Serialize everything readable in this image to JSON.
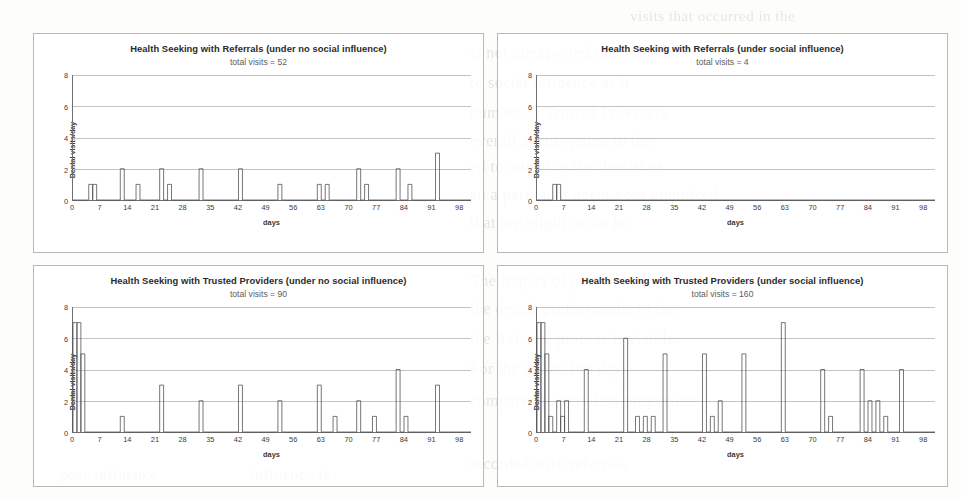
{
  "page": {
    "background_color": "#fdfdfc",
    "ghost_text": [
      {
        "t": "visits that occurred in the",
        "x": 630,
        "y": 8,
        "s": 15
      },
      {
        "t": "is not unexpected that there is",
        "x": 470,
        "y": 44,
        "s": 16
      },
      {
        "t": "to social influence as it",
        "x": 470,
        "y": 74,
        "s": 16
      },
      {
        "t": "number of Trusted Providers",
        "x": 470,
        "y": 104,
        "s": 16
      },
      {
        "t": "everall agents going to the",
        "x": 470,
        "y": 132,
        "s": 16
      },
      {
        "t": "ed to attend to the dentist as",
        "x": 470,
        "y": 158,
        "s": 16
      },
      {
        "t": "en a particular agent goes unnoticed",
        "x": 470,
        "y": 186,
        "s": 16
      },
      {
        "t": "that are might occur in",
        "x": 470,
        "y": 214,
        "s": 16
      },
      {
        "t": "The impact of peer",
        "x": 470,
        "y": 272,
        "s": 16
      },
      {
        "t": "the dental professionals in the",
        "x": 470,
        "y": 300,
        "s": 16
      },
      {
        "t": "the Referral process is visible",
        "x": 470,
        "y": 330,
        "s": 16
      },
      {
        "t": "For the entire 100 days",
        "x": 470,
        "y": 360,
        "s": 16
      },
      {
        "t": "compared to very low proportion",
        "x": 470,
        "y": 392,
        "s": 16
      },
      {
        "t": "recorded with referrals",
        "x": 470,
        "y": 455,
        "s": 16
      },
      {
        "t": "peer influence",
        "x": 60,
        "y": 466,
        "s": 16
      },
      {
        "t": "influence is",
        "x": 250,
        "y": 466,
        "s": 16
      }
    ]
  },
  "charts": [
    {
      "id": "referrals-no-social",
      "title": "Health Seeking with Referrals (under no social influence)",
      "subtitle": "total visits = 52",
      "ylabel": "Dental visits/day",
      "xlabel": "days",
      "yticks": [
        0,
        2,
        4,
        6,
        8
      ],
      "xticks": [
        0,
        7,
        14,
        21,
        28,
        35,
        42,
        49,
        56,
        63,
        70,
        77,
        84,
        91,
        98
      ],
      "chart_data": {
        "type": "bar",
        "title": "Health Seeking with Referrals (under no social influence)",
        "subtitle": "total visits = 52",
        "xlabel": "days",
        "ylabel": "Dental visits/day",
        "xlim": [
          0,
          101
        ],
        "ylim": [
          0,
          8
        ],
        "grid": true,
        "legend": "none",
        "annotation": "total visits = 52",
        "points": [
          {
            "day": 4,
            "value": 1
          },
          {
            "day": 5,
            "value": 1
          },
          {
            "day": 12,
            "value": 2
          },
          {
            "day": 16,
            "value": 1
          },
          {
            "day": 22,
            "value": 2
          },
          {
            "day": 24,
            "value": 1
          },
          {
            "day": 32,
            "value": 2
          },
          {
            "day": 42,
            "value": 2
          },
          {
            "day": 52,
            "value": 1
          },
          {
            "day": 62,
            "value": 1
          },
          {
            "day": 64,
            "value": 1
          },
          {
            "day": 72,
            "value": 2
          },
          {
            "day": 74,
            "value": 1
          },
          {
            "day": 82,
            "value": 2
          },
          {
            "day": 85,
            "value": 1
          },
          {
            "day": 92,
            "value": 3
          }
        ]
      }
    },
    {
      "id": "referrals-social",
      "title": "Health Seeking with Referrals (under social influence)",
      "subtitle": "total visits = 4",
      "ylabel": "Dental visits/day",
      "xlabel": "days",
      "yticks": [
        0,
        2,
        4,
        6,
        8
      ],
      "xticks": [
        0,
        7,
        14,
        21,
        28,
        35,
        42,
        49,
        56,
        63,
        70,
        77,
        84,
        91,
        98
      ],
      "chart_data": {
        "type": "bar",
        "title": "Health Seeking with Referrals (under social influence)",
        "subtitle": "total visits = 4",
        "xlabel": "days",
        "ylabel": "Dental visits/day",
        "xlim": [
          0,
          101
        ],
        "ylim": [
          0,
          8
        ],
        "grid": true,
        "legend": "none",
        "annotation": "total visits = 4",
        "points": [
          {
            "day": 4,
            "value": 1
          },
          {
            "day": 5,
            "value": 1
          }
        ]
      }
    },
    {
      "id": "trusted-no-social",
      "title": "Health Seeking with Trusted Providers (under no social influence)",
      "subtitle": "total visits = 90",
      "ylabel": "Dental visits/day",
      "xlabel": "days",
      "yticks": [
        0,
        2,
        4,
        6,
        8
      ],
      "xticks": [
        0,
        7,
        14,
        21,
        28,
        35,
        42,
        49,
        56,
        63,
        70,
        77,
        84,
        91,
        98
      ],
      "chart_data": {
        "type": "bar",
        "title": "Health Seeking with Trusted Providers (under no social influence)",
        "subtitle": "total visits = 90",
        "xlabel": "days",
        "ylabel": "Dental visits/day",
        "xlim": [
          0,
          101
        ],
        "ylim": [
          0,
          8
        ],
        "grid": true,
        "legend": "none",
        "annotation": "total visits = 90",
        "points": [
          {
            "day": 0,
            "value": 7
          },
          {
            "day": 1,
            "value": 7
          },
          {
            "day": 2,
            "value": 5
          },
          {
            "day": 12,
            "value": 1
          },
          {
            "day": 22,
            "value": 3
          },
          {
            "day": 32,
            "value": 2
          },
          {
            "day": 42,
            "value": 3
          },
          {
            "day": 52,
            "value": 2
          },
          {
            "day": 62,
            "value": 3
          },
          {
            "day": 66,
            "value": 1
          },
          {
            "day": 72,
            "value": 2
          },
          {
            "day": 76,
            "value": 1
          },
          {
            "day": 82,
            "value": 4
          },
          {
            "day": 84,
            "value": 1
          },
          {
            "day": 92,
            "value": 3
          }
        ]
      }
    },
    {
      "id": "trusted-social",
      "title": "Health Seeking with Trusted Providers (under social influence)",
      "subtitle": "total visits = 160",
      "ylabel": "Dental visits/day",
      "xlabel": "days",
      "yticks": [
        0,
        2,
        4,
        6,
        8
      ],
      "xticks": [
        0,
        7,
        14,
        21,
        28,
        35,
        42,
        49,
        56,
        63,
        70,
        77,
        84,
        91,
        98
      ],
      "chart_data": {
        "type": "bar",
        "title": "Health Seeking with Trusted Providers (under social influence)",
        "subtitle": "total visits = 160",
        "xlabel": "days",
        "ylabel": "Dental visits/day",
        "xlim": [
          0,
          101
        ],
        "ylim": [
          0,
          8
        ],
        "grid": true,
        "legend": "none",
        "annotation": "total visits = 160",
        "points": [
          {
            "day": 0,
            "value": 7
          },
          {
            "day": 1,
            "value": 7
          },
          {
            "day": 2,
            "value": 5
          },
          {
            "day": 3,
            "value": 1
          },
          {
            "day": 5,
            "value": 2
          },
          {
            "day": 6,
            "value": 1
          },
          {
            "day": 7,
            "value": 2
          },
          {
            "day": 12,
            "value": 4
          },
          {
            "day": 22,
            "value": 6
          },
          {
            "day": 25,
            "value": 1
          },
          {
            "day": 27,
            "value": 1
          },
          {
            "day": 29,
            "value": 1
          },
          {
            "day": 32,
            "value": 5
          },
          {
            "day": 42,
            "value": 5
          },
          {
            "day": 44,
            "value": 1
          },
          {
            "day": 46,
            "value": 2
          },
          {
            "day": 52,
            "value": 5
          },
          {
            "day": 62,
            "value": 7
          },
          {
            "day": 72,
            "value": 4
          },
          {
            "day": 74,
            "value": 1
          },
          {
            "day": 82,
            "value": 4
          },
          {
            "day": 84,
            "value": 2
          },
          {
            "day": 86,
            "value": 2
          },
          {
            "day": 88,
            "value": 1
          },
          {
            "day": 92,
            "value": 4
          }
        ]
      }
    }
  ]
}
